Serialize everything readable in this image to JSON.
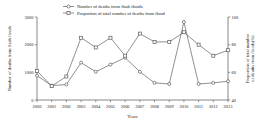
{
  "chart_data": {
    "type": "line",
    "title": "",
    "xlabel": "Years",
    "ylabel": "Number of deaths from flash floods",
    "ylabel_right": "Proportion of total number of deaths from floods(%)",
    "categories": [
      "2000",
      "2001",
      "2002",
      "2003",
      "2004",
      "2005",
      "2006",
      "2007",
      "2008",
      "2009",
      "2010",
      "2011",
      "2012",
      "2013"
    ],
    "x": [
      2000,
      2001,
      2002,
      2003,
      2004,
      2005,
      2006,
      2007,
      2008,
      2009,
      2010,
      2011,
      2012,
      2013
    ],
    "ylim": [
      0,
      3000
    ],
    "yticks": [
      "0",
      "1000",
      "2000",
      "3000"
    ],
    "ytick_values": [
      0,
      1000,
      2000,
      3000
    ],
    "ylim_right": [
      40,
      100
    ],
    "yticks_right": [
      "40",
      "60",
      "80",
      "100"
    ],
    "ytick_values_right": [
      40,
      60,
      80,
      100
    ],
    "grid": false,
    "legend_position": "top-center",
    "series": [
      {
        "name": "Number of deaths from flash floods",
        "axis": "left",
        "marker": "open-circle",
        "values": [
          880,
          520,
          560,
          1350,
          1020,
          1280,
          1530,
          1020,
          620,
          580,
          2820,
          580,
          620,
          680
        ]
      },
      {
        "name": "Proportion of total number of deaths from flood",
        "axis": "right",
        "marker": "open-square",
        "values": [
          61,
          50,
          57,
          85,
          78,
          85,
          72,
          88,
          82,
          82,
          89,
          80,
          72,
          76
        ]
      }
    ]
  },
  "legend": {
    "entries": [
      {
        "label": "Number of deaths from flash floods"
      },
      {
        "label": "Proportion of total number of deaths from flood"
      }
    ]
  },
  "colors": {
    "line": "#6b6b6b",
    "axis": "#555555",
    "text": "#222222",
    "background": "#ffffff"
  }
}
